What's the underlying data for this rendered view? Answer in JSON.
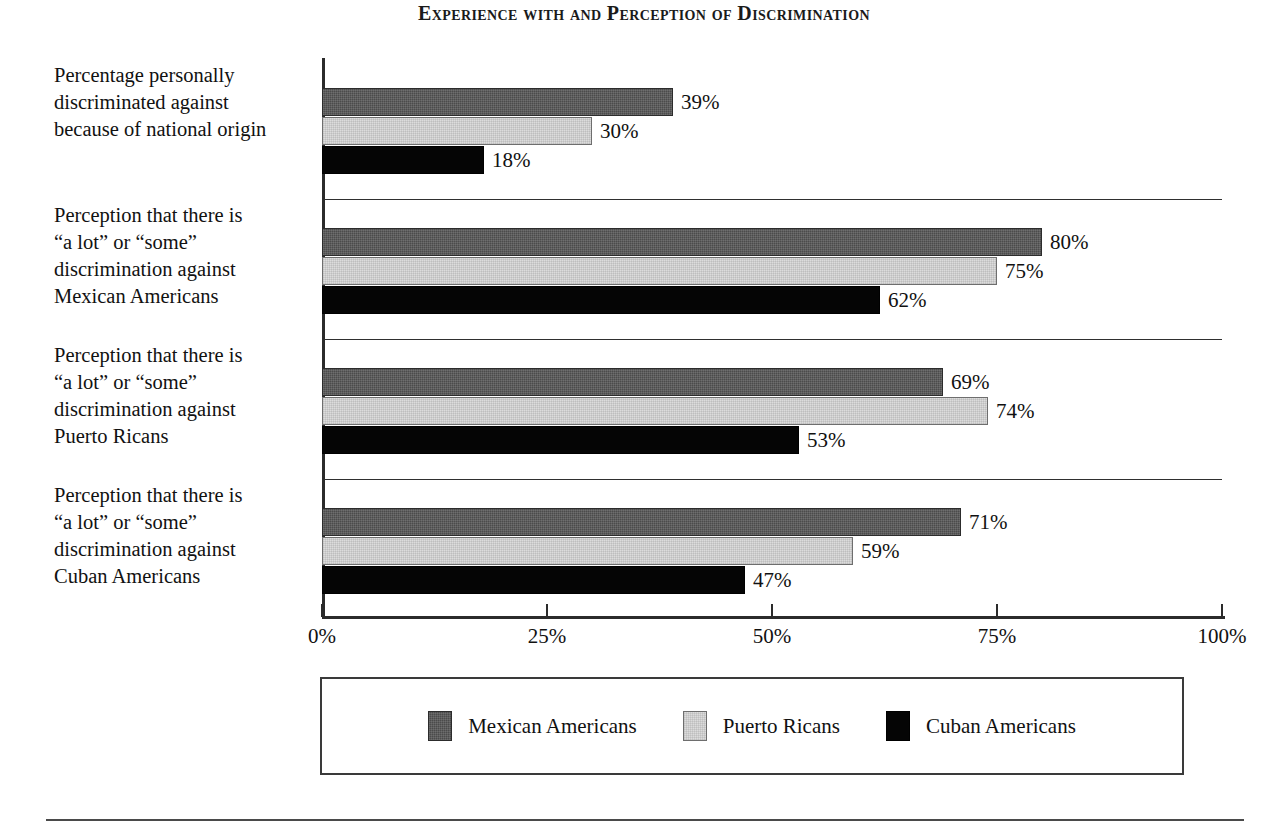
{
  "chart_data": {
    "type": "bar",
    "orientation": "horizontal",
    "title": "Experience with and Perception of Discrimination",
    "xlabel": "",
    "ylabel": "",
    "xlim": [
      0,
      100
    ],
    "xticks": [
      "0%",
      "25%",
      "50%",
      "75%",
      "100%"
    ],
    "xtick_values": [
      0,
      25,
      50,
      75,
      100
    ],
    "grid": false,
    "legend_position": "bottom",
    "value_suffix": "%",
    "categories": [
      "Percentage personally discriminated against because of national origin",
      "Perception that there is “a lot” or “some” discrimination against Mexican Americans",
      "Perception that there is “a lot” or “some” discrimination against Puerto Ricans",
      "Perception that there is “a lot” or “some” discrimination against Cuban Americans"
    ],
    "category_lines": [
      [
        "Percentage personally",
        "discriminated against",
        "because of national origin"
      ],
      [
        "Perception that there is",
        "“a lot” or “some”",
        "discrimination against",
        "Mexican Americans"
      ],
      [
        "Perception that there is",
        "“a lot” or “some”",
        "discrimination against",
        "Puerto Ricans"
      ],
      [
        "Perception that there is",
        "“a lot” or “some”",
        "discrimination against",
        "Cuban Americans"
      ]
    ],
    "series": [
      {
        "name": "Mexican Americans",
        "color": "#4b4b4b",
        "values": [
          39,
          80,
          69,
          71
        ],
        "labels": [
          "39%",
          "80%",
          "69%",
          "71%"
        ]
      },
      {
        "name": "Puerto Ricans",
        "color": "#dcdcdc",
        "values": [
          30,
          75,
          74,
          59
        ],
        "labels": [
          "30%",
          "75%",
          "74%",
          "59%"
        ]
      },
      {
        "name": "Cuban Americans",
        "color": "#050505",
        "values": [
          18,
          62,
          53,
          47
        ],
        "labels": [
          "18%",
          "62%",
          "53%",
          "47%"
        ]
      }
    ]
  },
  "legend": {
    "items": [
      {
        "label": "Mexican Americans"
      },
      {
        "label": "Puerto Ricans"
      },
      {
        "label": "Cuban Americans"
      }
    ]
  }
}
